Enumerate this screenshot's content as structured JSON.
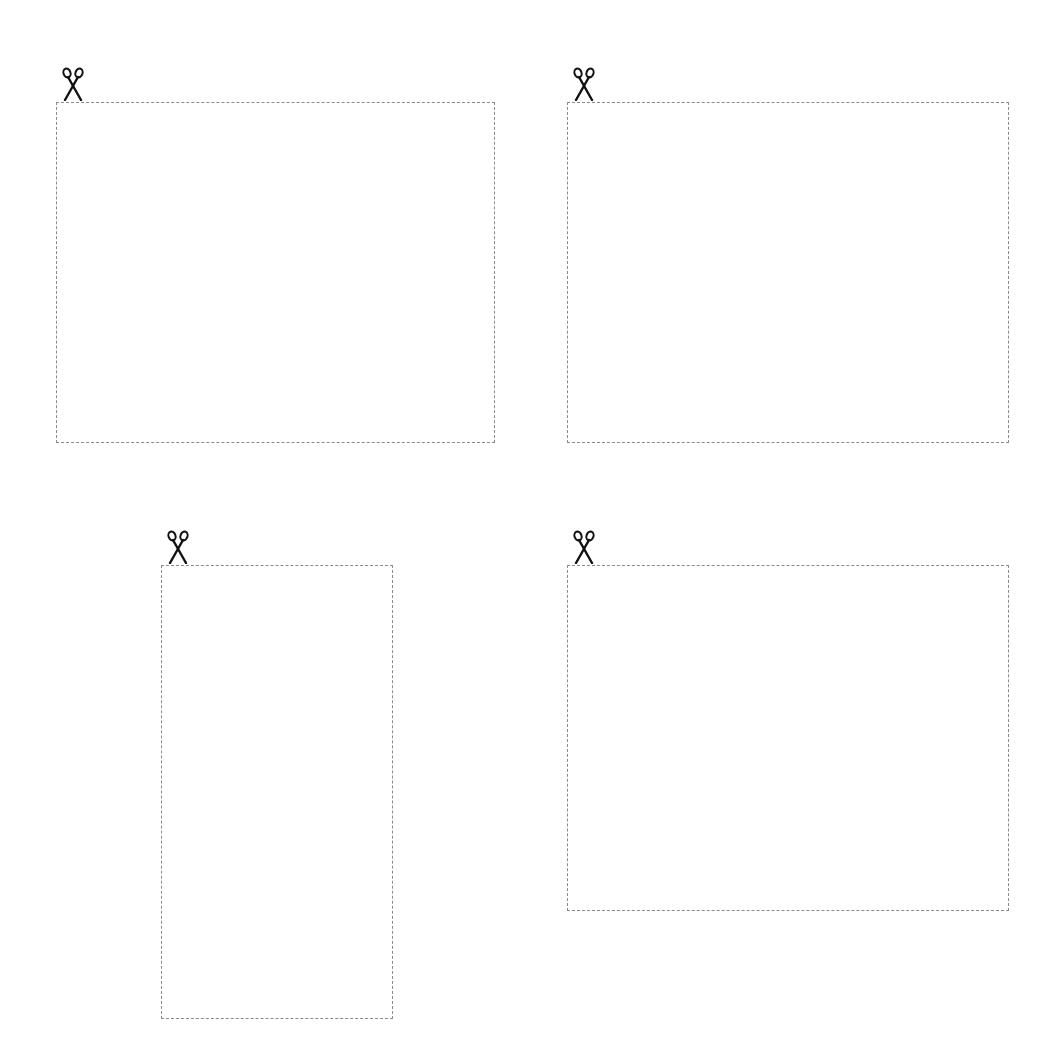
{
  "cutouts": [
    {
      "id": "box1",
      "icon": "scissors-icon",
      "content": ""
    },
    {
      "id": "box2",
      "icon": "scissors-icon",
      "content": ""
    },
    {
      "id": "box3",
      "icon": "scissors-icon",
      "content": ""
    },
    {
      "id": "box4",
      "icon": "scissors-icon",
      "content": ""
    }
  ],
  "colors": {
    "border": "#8a8a8a",
    "icon": "#111111",
    "background": "#ffffff"
  }
}
